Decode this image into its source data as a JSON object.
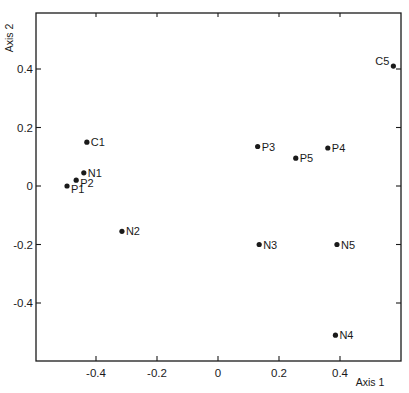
{
  "chart_data": {
    "type": "scatter",
    "title": "",
    "xlabel": "Axis 1",
    "ylabel": "Axis 2",
    "xlim": [
      -0.6,
      0.6
    ],
    "ylim": [
      -0.6,
      0.595
    ],
    "grid": false,
    "legend": null,
    "x_ticks": [
      -0.4,
      -0.2,
      0,
      0.2,
      0.4
    ],
    "x_tick_labels": [
      "-0.4",
      "-0.2",
      "0",
      "0.2",
      "0.4"
    ],
    "y_ticks": [
      -0.4,
      -0.2,
      0,
      0.2,
      0.4
    ],
    "y_tick_labels": [
      "-0.4",
      "-0.2",
      "0",
      "0.2",
      "0.4"
    ],
    "points": [
      {
        "label": "C1",
        "x": -0.43,
        "y": 0.15,
        "label_pos": "right"
      },
      {
        "label": "N1",
        "x": -0.44,
        "y": 0.045,
        "label_pos": "right"
      },
      {
        "label": "P2",
        "x": -0.465,
        "y": 0.02,
        "label_pos": "right-below"
      },
      {
        "label": "P1",
        "x": -0.495,
        "y": 0.0,
        "label_pos": "right-below"
      },
      {
        "label": "N2",
        "x": -0.315,
        "y": -0.155,
        "label_pos": "right"
      },
      {
        "label": "P3",
        "x": 0.13,
        "y": 0.135,
        "label_pos": "right"
      },
      {
        "label": "P5",
        "x": 0.255,
        "y": 0.095,
        "label_pos": "right"
      },
      {
        "label": "P4",
        "x": 0.36,
        "y": 0.13,
        "label_pos": "right"
      },
      {
        "label": "C5",
        "x": 0.575,
        "y": 0.41,
        "label_pos": "left"
      },
      {
        "label": "N3",
        "x": 0.135,
        "y": -0.2,
        "label_pos": "right"
      },
      {
        "label": "N5",
        "x": 0.39,
        "y": -0.2,
        "label_pos": "right"
      },
      {
        "label": "N4",
        "x": 0.385,
        "y": -0.51,
        "label_pos": "right"
      }
    ]
  },
  "colors": {
    "ink": "#1a1a1a",
    "background": "#ffffff"
  }
}
